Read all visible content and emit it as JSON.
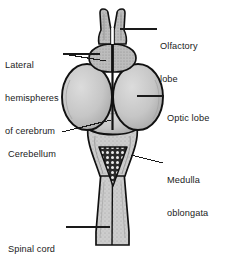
{
  "figure": {
    "type": "anatomical-diagram",
    "view": "dorsal",
    "colors": {
      "fill": "#c9c9c9",
      "fill_light": "#d6d6d6",
      "fill_dark": "#b4b4b4",
      "outline": "#111111",
      "leader": "#1a1a1a",
      "background": "#ffffff",
      "text": "#1a1a1a"
    }
  },
  "labels": [
    {
      "id": "olfactory-lobe",
      "line1": "Olfactory",
      "line2": "lobe",
      "side": "right",
      "x": 160,
      "y": 24
    },
    {
      "id": "lateral-hemispheres-of-cerebrum",
      "line1": "Lateral",
      "line2": "hemispheres",
      "line3": "of cerebrum",
      "side": "left",
      "x": 5,
      "y": 41
    },
    {
      "id": "optic-lobe",
      "line1": "Optic lobe",
      "side": "right",
      "x": 166,
      "y": 91
    },
    {
      "id": "cerebellum",
      "line1": "Cerebellum",
      "side": "left",
      "x": 8,
      "y": 127
    },
    {
      "id": "medulla-oblongata",
      "line1": "Medulla",
      "line2": "oblongata",
      "side": "right",
      "x": 166,
      "y": 155
    },
    {
      "id": "spinal-cord",
      "line1": "Spinal cord",
      "side": "left",
      "x": 8,
      "y": 221
    }
  ],
  "structures": [
    {
      "id": "olfactory-lobe-left",
      "name": "Olfactory lobe (left)"
    },
    {
      "id": "olfactory-lobe-right",
      "name": "Olfactory lobe (right)"
    },
    {
      "id": "cerebral-hemisphere-left",
      "name": "Lateral hemisphere of cerebrum (left)"
    },
    {
      "id": "cerebral-hemisphere-right",
      "name": "Lateral hemisphere of cerebrum (right)"
    },
    {
      "id": "optic-lobe-left",
      "name": "Optic lobe (left)"
    },
    {
      "id": "optic-lobe-right",
      "name": "Optic lobe (right)"
    },
    {
      "id": "cerebellum",
      "name": "Cerebellum"
    },
    {
      "id": "fourth-ventricle",
      "name": "Fourth ventricle (choroid plexus)"
    },
    {
      "id": "medulla-oblongata",
      "name": "Medulla oblongata"
    },
    {
      "id": "spinal-cord",
      "name": "Spinal cord"
    }
  ]
}
